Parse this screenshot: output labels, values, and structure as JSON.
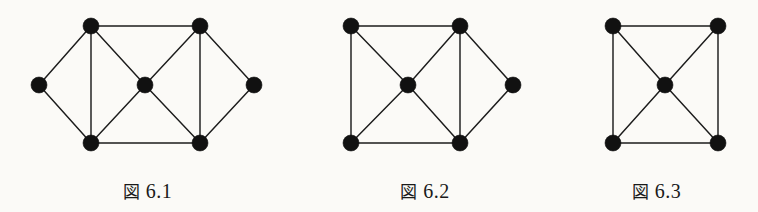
{
  "page": {
    "background_color": "#fbfaf7",
    "ink_color": "#1a1a1a",
    "width": 758,
    "height": 212
  },
  "figures": [
    {
      "id": "figure-6-1",
      "caption_kanji": "図",
      "caption_number": "6.1",
      "caption_full": "図 6.1",
      "caption_y": 178,
      "block_left": 0,
      "block_width": 295,
      "node_radius": 8,
      "node_count": 7,
      "edge_count": 12,
      "nodes": [
        {
          "name": "left",
          "x": 39,
          "y": 85
        },
        {
          "name": "top-left",
          "x": 91,
          "y": 26
        },
        {
          "name": "bottom-left",
          "x": 91,
          "y": 143
        },
        {
          "name": "center",
          "x": 145,
          "y": 85
        },
        {
          "name": "top-right",
          "x": 200,
          "y": 26
        },
        {
          "name": "bottom-right",
          "x": 200,
          "y": 143
        },
        {
          "name": "right",
          "x": 254,
          "y": 85
        }
      ],
      "edges": [
        [
          0,
          1
        ],
        [
          0,
          2
        ],
        [
          1,
          2
        ],
        [
          1,
          3
        ],
        [
          2,
          3
        ],
        [
          1,
          4
        ],
        [
          2,
          5
        ],
        [
          3,
          4
        ],
        [
          3,
          5
        ],
        [
          4,
          5
        ],
        [
          4,
          6
        ],
        [
          5,
          6
        ]
      ]
    },
    {
      "id": "figure-6-2",
      "caption_kanji": "図",
      "caption_number": "6.2",
      "caption_full": "図 6.2",
      "caption_y": 178,
      "block_left": 295,
      "block_width": 260,
      "node_radius": 8,
      "node_count": 6,
      "edge_count": 10,
      "nodes": [
        {
          "name": "top-left",
          "x": 56,
          "y": 26
        },
        {
          "name": "bottom-left",
          "x": 56,
          "y": 143
        },
        {
          "name": "center",
          "x": 113,
          "y": 85
        },
        {
          "name": "top-right",
          "x": 165,
          "y": 26
        },
        {
          "name": "bottom-right",
          "x": 165,
          "y": 143
        },
        {
          "name": "right",
          "x": 218,
          "y": 85
        }
      ],
      "edges": [
        [
          0,
          1
        ],
        [
          0,
          2
        ],
        [
          1,
          2
        ],
        [
          0,
          3
        ],
        [
          1,
          4
        ],
        [
          2,
          3
        ],
        [
          2,
          4
        ],
        [
          3,
          4
        ],
        [
          3,
          5
        ],
        [
          4,
          5
        ]
      ]
    },
    {
      "id": "figure-6-3",
      "caption_kanji": "図",
      "caption_number": "6.3",
      "caption_full": "図 6.3",
      "caption_y": 178,
      "block_left": 555,
      "block_width": 203,
      "node_radius": 8,
      "node_count": 5,
      "edge_count": 8,
      "nodes": [
        {
          "name": "top-left",
          "x": 58,
          "y": 26
        },
        {
          "name": "top-right",
          "x": 163,
          "y": 26
        },
        {
          "name": "bottom-left",
          "x": 58,
          "y": 143
        },
        {
          "name": "bottom-right",
          "x": 163,
          "y": 143
        },
        {
          "name": "center",
          "x": 110,
          "y": 85
        }
      ],
      "edges": [
        [
          0,
          1
        ],
        [
          0,
          2
        ],
        [
          1,
          3
        ],
        [
          2,
          3
        ],
        [
          4,
          0
        ],
        [
          4,
          1
        ],
        [
          4,
          2
        ],
        [
          4,
          3
        ]
      ]
    }
  ]
}
